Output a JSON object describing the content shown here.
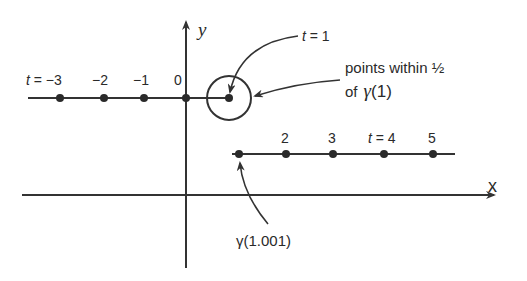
{
  "figure": {
    "type": "diagram",
    "axes": {
      "x_label": "x",
      "y_label": "y",
      "origin_label": "0"
    },
    "upper_branch": {
      "points": [
        {
          "t": -3,
          "label": "t = −3"
        },
        {
          "t": -2,
          "label": "−2"
        },
        {
          "t": -1,
          "label": "−1"
        },
        {
          "t": 0,
          "label": "0"
        },
        {
          "t": 1,
          "label": "t = 1"
        }
      ]
    },
    "lower_branch": {
      "points": [
        {
          "t": 1.001,
          "label": "γ(1.001)"
        },
        {
          "t": 2,
          "label": "2"
        },
        {
          "t": 3,
          "label": "3"
        },
        {
          "t": 4,
          "label": "t = 4"
        },
        {
          "t": 5,
          "label": "5"
        }
      ]
    },
    "annotations": {
      "t1": "t = 1",
      "neighborhood_line1": "points within ½",
      "neighborhood_line2_prefix": "of",
      "neighborhood_line2_gamma": "γ",
      "neighborhood_line2_arg": "(1)",
      "gamma_1001": "γ(1.001)"
    },
    "labels": {
      "t_eq_m3_t": "t",
      "t_eq_m3_rest": " = −3",
      "m2": "−2",
      "m1": "−1",
      "zero": "0",
      "t_eq_1_t": "t",
      "t_eq_1_rest": " = 1",
      "two": "2",
      "three": "3",
      "t_eq_4_t": "t",
      "t_eq_4_rest": " = 4",
      "five": "5",
      "x": "x",
      "y": "y"
    },
    "colors": {
      "ink": "#2a2a2a",
      "background": "#ffffff"
    }
  }
}
